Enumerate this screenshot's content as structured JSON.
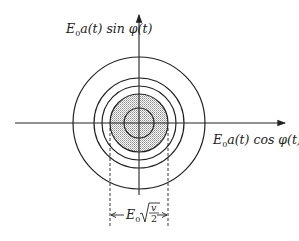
{
  "diagram": {
    "y_axis_label": {
      "prefix": "E",
      "sub": "0",
      "body": "a(t) sin φ(t)"
    },
    "x_axis_label": {
      "prefix": "E",
      "sub": "0",
      "body": "a(t) cos φ(t)"
    },
    "dimension_label": {
      "prefix": "E",
      "sub": "0",
      "numerator": "v",
      "denominator": "2"
    },
    "center": [
      139,
      123
    ],
    "circle_radii": [
      66,
      45,
      37,
      29,
      15
    ],
    "shaded_radius": 29,
    "colors": {
      "stroke": "#222222",
      "shading": "#bfbfbf"
    }
  }
}
